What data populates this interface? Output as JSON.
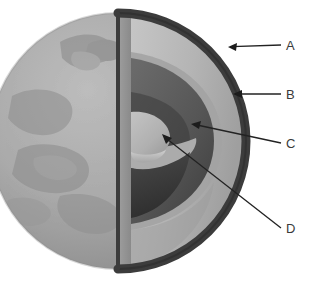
{
  "figure": {
    "background_color": "#ffffff",
    "globe": {
      "center_x": 118,
      "center_y": 141,
      "radius": 128,
      "surface_color": "#a9a9a9",
      "surface_shadow_color": "#8f8f8f",
      "continent_color": "#9a9a9a",
      "highlight_color": "#b8b8b8"
    },
    "layers": [
      {
        "key": "crust",
        "label": "A",
        "color": "#3c3c3c",
        "description": "outer dark rim of cutaway"
      },
      {
        "key": "mantle",
        "label": "B",
        "color": "#b4b4b4",
        "description": "light gray layer beneath crust"
      },
      {
        "key": "outer-core",
        "label": "C",
        "color": "#5d5d5d",
        "description": "dark gray layer surrounding core"
      },
      {
        "key": "inner-core",
        "label": "D",
        "color": "#b0b0b0",
        "description": "innermost light dome"
      }
    ],
    "callouts": [
      {
        "label": "A",
        "label_x": 288,
        "label_y": 50,
        "line_x1": 281,
        "line_y1": 45,
        "line_x2": 229,
        "line_y2": 47,
        "arrow": true
      },
      {
        "label": "B",
        "label_x": 288,
        "label_y": 99,
        "line_x1": 281,
        "line_y1": 94,
        "line_x2": 234,
        "line_y2": 94,
        "arrow": true
      },
      {
        "label": "C",
        "label_x": 288,
        "label_y": 148,
        "line_x1": 281,
        "line_y1": 143,
        "line_x2": 192,
        "line_y2": 124,
        "arrow": true
      },
      {
        "label": "D",
        "label_x": 288,
        "label_y": 233,
        "line_x1": 281,
        "line_y1": 228,
        "line_x2": 163,
        "line_y2": 135,
        "arrow": true
      }
    ],
    "line_color": "#222222",
    "label_color": "#3a3a3a"
  }
}
